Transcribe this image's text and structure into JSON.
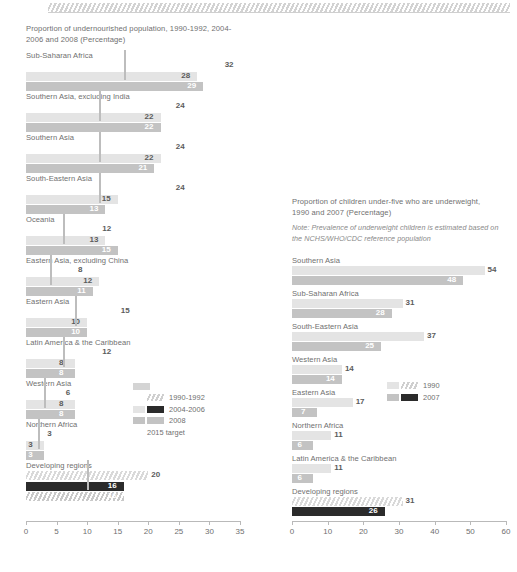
{
  "decor": {
    "top_band": "hatched-band"
  },
  "chart_data": [
    {
      "id": "undernourished",
      "type": "bar",
      "orientation": "horizontal",
      "title": "Proportion of undernourished population, 1990-1992, 2004-2006 and 2008 (Percentage)",
      "xlabel": "",
      "ylabel": "",
      "xlim": [
        0,
        35
      ],
      "xticks": [
        0,
        5,
        10,
        15,
        20,
        25,
        30,
        35
      ],
      "grid": false,
      "legend_position": "bottom-right",
      "legend": [
        {
          "label": "1990-1992",
          "swatch": "hatch"
        },
        {
          "label": "2004-2006",
          "swatch": "light-and-dark"
        },
        {
          "label": "2008",
          "swatch": "mid"
        },
        {
          "label": "2015 target",
          "swatch": "target"
        }
      ],
      "series": [
        {
          "name": "1990-1992",
          "style": "hatch"
        },
        {
          "name": "2004-2006",
          "style": "light"
        },
        {
          "name": "2008",
          "style": "mid"
        },
        {
          "name": "2015 target",
          "style": "marker"
        }
      ],
      "categories": [
        "Sub-Saharan Africa",
        "Southern Asia, excluding India",
        "Southern Asia",
        "South-Eastern Asia",
        "Oceania",
        "Eastern Asia, excluding China",
        "Eastern Asia",
        "Latin America & the Caribbean",
        "Western Asia",
        "Northern Africa",
        "Developing regions"
      ],
      "rows": [
        {
          "category": "Sub-Saharan Africa",
          "v1990": 32,
          "v2004": 28,
          "v2008": 29,
          "target": 16
        },
        {
          "category": "Southern Asia, excluding India",
          "v1990": 24,
          "v2004": 22,
          "v2008": 22,
          "target": 12
        },
        {
          "category": "Southern Asia",
          "v1990": 24,
          "v2004": 22,
          "v2008": 21,
          "target": 12
        },
        {
          "category": "South-Eastern Asia",
          "v1990": 24,
          "v2004": 15,
          "v2008": 13,
          "target": 12
        },
        {
          "category": "Oceania",
          "v1990": 12,
          "v2004": 13,
          "v2008": 15,
          "target": 6
        },
        {
          "category": "Eastern Asia, excluding China",
          "v1990": 8,
          "v2004": 12,
          "v2008": 11,
          "target": 4
        },
        {
          "category": "Eastern Asia",
          "v1990": 15,
          "v2004": 10,
          "v2008": 10,
          "target": 8
        },
        {
          "category": "Latin America & the Caribbean",
          "v1990": 12,
          "v2004": 8,
          "v2008": 8,
          "target": 6
        },
        {
          "category": "Western Asia",
          "v1990": 6,
          "v2004": 8,
          "v2008": 8,
          "target": 3
        },
        {
          "category": "Northern Africa",
          "v1990": 3,
          "v2004": 3,
          "v2008": 3,
          "target": 2
        },
        {
          "category": "Developing regions",
          "v1990": 20,
          "v2004": 16,
          "v2008": 16,
          "target": 10
        }
      ]
    },
    {
      "id": "underweight",
      "type": "bar",
      "orientation": "horizontal",
      "title": "Proportion of children under-five who are underweight, 1990 and 2007 (Percentage)",
      "note": "Note: Prevalence of underweight children is estimated based on the NCHS/WHO/CDC reference population",
      "xlabel": "",
      "ylabel": "",
      "xlim": [
        0,
        60
      ],
      "xticks": [
        0,
        10,
        20,
        30,
        40,
        50,
        60
      ],
      "grid": false,
      "legend_position": "middle-right",
      "legend": [
        {
          "label": "1990",
          "swatch": "hatch"
        },
        {
          "label": "2007",
          "swatch": "dark"
        }
      ],
      "series": [
        {
          "name": "1990",
          "style": "light"
        },
        {
          "name": "2007",
          "style": "mid"
        }
      ],
      "categories": [
        "Southern Asia",
        "Sub-Saharan Africa",
        "South-Eastern Asia",
        "Western Asia",
        "Eastern Asia",
        "Northern Africa",
        "Latin America & the Caribbean",
        "Developing regions"
      ],
      "rows": [
        {
          "category": "Southern Asia",
          "v1990": 54,
          "v2007": 48
        },
        {
          "category": "Sub-Saharan Africa",
          "v1990": 31,
          "v2007": 28
        },
        {
          "category": "South-Eastern Asia",
          "v1990": 37,
          "v2007": 25
        },
        {
          "category": "Western Asia",
          "v1990": 14,
          "v2007": 14
        },
        {
          "category": "Eastern Asia",
          "v1990": 17,
          "v2007": 7
        },
        {
          "category": "Northern Africa",
          "v1990": 11,
          "v2007": 6
        },
        {
          "category": "Latin America & the Caribbean",
          "v1990": 11,
          "v2007": 6
        },
        {
          "category": "Developing regions",
          "v1990": 31,
          "v2007": 26
        }
      ]
    }
  ],
  "colors": {
    "hatch": "#d9d9d9",
    "light": "#e4e4e4",
    "mid": "#c3c3c3",
    "dark": "#2b2b2b",
    "text": "#6f6f6f",
    "axis": "#b9b9b9"
  }
}
